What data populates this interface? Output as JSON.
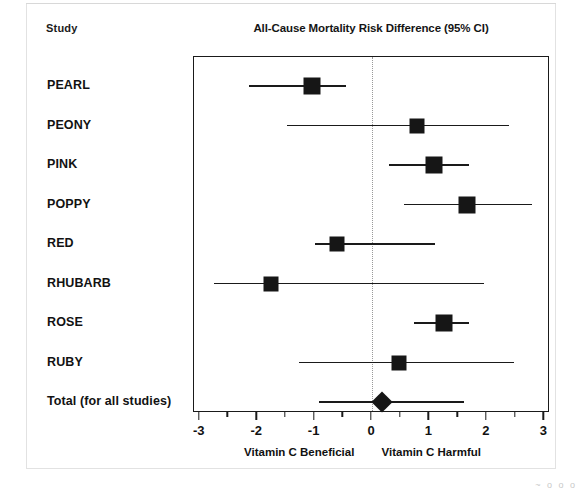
{
  "figure": {
    "study_column_header": "Study",
    "title": "All-Cause Mortality Risk Difference (95% CI)",
    "left_footnote": "Vitamin C Beneficial",
    "right_footnote": "Vitamin C Harmful",
    "scan_artifact": "~ o o o"
  },
  "chart_data": {
    "type": "forest",
    "title": "All-Cause Mortality Risk Difference (95% CI)",
    "xlabel": "",
    "ylabel": "Study",
    "xlim": [
      -3.1,
      3.1
    ],
    "xticks": [
      -3,
      -2,
      -1,
      0,
      1,
      2,
      3
    ],
    "xticklabels": [
      "-3",
      "-2",
      "-1",
      "0",
      "1",
      "2",
      "3"
    ],
    "minor_ticks": [
      -2.5,
      -1.5,
      -0.5,
      0.5,
      1.5,
      2.5
    ],
    "grid": false,
    "null_line": 0,
    "null_line_style": "dotted",
    "legend": "none",
    "left_footnote": "Vitamin C Beneficial",
    "right_footnote": "Vitamin C Harmful",
    "categories": [
      "PEARL",
      "PEONY",
      "PINK",
      "POPPY",
      "RED",
      "RHUBARB",
      "ROSE",
      "RUBY",
      "Total (for all studies)"
    ],
    "rows": [
      {
        "label": "PEARL",
        "estimate": -1.05,
        "ci_low": -2.14,
        "ci_high": -0.45,
        "marker": "square",
        "marker_size": 17
      },
      {
        "label": "PEONY",
        "estimate": 0.78,
        "ci_low": -1.48,
        "ci_high": 2.38,
        "marker": "square",
        "marker_size": 15
      },
      {
        "label": "PINK",
        "estimate": 1.08,
        "ci_low": 0.3,
        "ci_high": 1.69,
        "marker": "square",
        "marker_size": 17
      },
      {
        "label": "POPPY",
        "estimate": 1.65,
        "ci_low": 0.56,
        "ci_high": 2.78,
        "marker": "square",
        "marker_size": 17
      },
      {
        "label": "RED",
        "estimate": -0.61,
        "ci_low": -0.99,
        "ci_high": 1.1,
        "marker": "square",
        "marker_size": 15
      },
      {
        "label": "RHUBARB",
        "estimate": -1.76,
        "ci_low": -2.75,
        "ci_high": 1.95,
        "marker": "square",
        "marker_size": 15
      },
      {
        "label": "ROSE",
        "estimate": 1.25,
        "ci_low": 0.73,
        "ci_high": 1.69,
        "marker": "square",
        "marker_size": 17
      },
      {
        "label": "RUBY",
        "estimate": 0.47,
        "ci_low": -1.27,
        "ci_high": 2.47,
        "marker": "square",
        "marker_size": 15
      },
      {
        "label": "Total (for all studies)",
        "estimate": 0.17,
        "ci_low": -0.92,
        "ci_high": 1.6,
        "marker": "diamond",
        "marker_size": 15
      }
    ]
  },
  "colors": {
    "marker": "#161616",
    "line": "#1a1a1a",
    "box_border": "#1a1a1a",
    "null_line": "#999999",
    "text": "#111111",
    "background": "#ffffff"
  }
}
